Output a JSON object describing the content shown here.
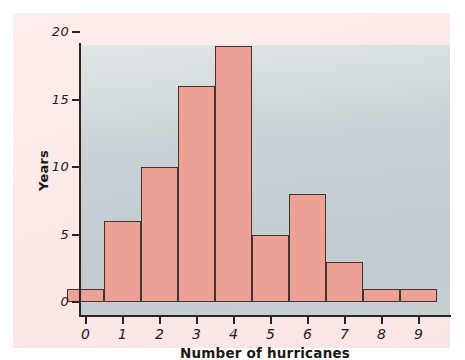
{
  "chart_data": {
    "type": "bar",
    "title": "",
    "subtitle": "",
    "xlabel": "Number of hurricanes",
    "ylabel": "Years",
    "categories": [
      "0",
      "1",
      "2",
      "3",
      "4",
      "5",
      "6",
      "7",
      "8",
      "9"
    ],
    "values": [
      1,
      6,
      10,
      16,
      19,
      5,
      8,
      3,
      1,
      1
    ],
    "xlim": [
      -0.5,
      9.5
    ],
    "ylim": [
      0,
      20
    ],
    "ytick_labels": [
      "0",
      "5",
      "10",
      "15",
      "20"
    ],
    "ytick_values": [
      0,
      5,
      10,
      15,
      20
    ],
    "xtick_labels": [
      "0",
      "1",
      "2",
      "3",
      "4",
      "5",
      "6",
      "7",
      "8",
      "9"
    ],
    "grid": false,
    "legend": false,
    "legend_position": "none",
    "bar_fill_color": "#eda095",
    "bar_edge_color": "#44342f",
    "plot_background_color": "#c9d2d6",
    "panel_background_color": "#fbe9e7",
    "axis_color": "#2c2420",
    "text_color": "#231b18"
  },
  "figure": {
    "x_axis_title": "Number of hurricanes",
    "y_axis_title": "Years"
  }
}
